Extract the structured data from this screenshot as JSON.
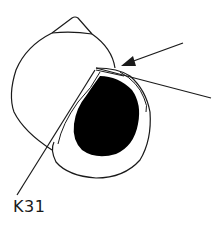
{
  "figure": {
    "label": "K31",
    "colors": {
      "stroke": "#1a1a1a",
      "fill_aperture_interior": "#000000",
      "background": "#ffffff"
    },
    "annotations": [
      {
        "type": "arrow",
        "from": [
          183,
          43
        ],
        "to": [
          121,
          66
        ]
      },
      {
        "type": "pointer-line",
        "from": [
          96,
          68
        ],
        "to": [
          211,
          98
        ]
      },
      {
        "type": "leader-line",
        "from": [
          95,
          70
        ],
        "to": [
          17,
          195
        ]
      }
    ]
  }
}
